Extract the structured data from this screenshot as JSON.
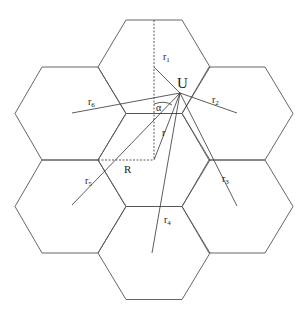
{
  "diagram": {
    "type": "hexagonal cellular layout",
    "labels": {
      "user": "U",
      "radius": "R",
      "angle": "α",
      "r": "r",
      "r1": "r",
      "r1_sub": "1",
      "r2": "r",
      "r2_sub": "2",
      "r3": "r",
      "r3_sub": "3",
      "r4": "r",
      "r4_sub": "4",
      "r5": "r",
      "r5_sub": "5",
      "r6": "r",
      "r6_sub": "6"
    },
    "cells": [
      {
        "name": "center",
        "cx": 154,
        "cy": 160
      },
      {
        "name": "top",
        "cx": 154,
        "cy": 67
      },
      {
        "name": "upper-right",
        "cx": 237,
        "cy": 113
      },
      {
        "name": "lower-right",
        "cx": 237,
        "cy": 206
      },
      {
        "name": "bottom",
        "cx": 154,
        "cy": 253
      },
      {
        "name": "lower-left",
        "cx": 70,
        "cy": 206
      },
      {
        "name": "upper-left",
        "cx": 70,
        "cy": 113
      }
    ],
    "user_position": {
      "x": 180,
      "y": 93
    },
    "stroke_color": "#555555"
  }
}
